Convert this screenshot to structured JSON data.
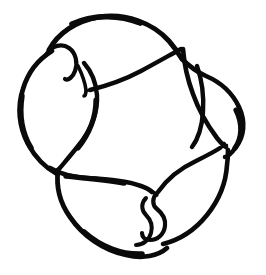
{
  "artwork": {
    "title": "Trefoil Knot",
    "subject": "three-crossing knot diagram",
    "style": "hand-drawn brush line drawing",
    "background_color": "#ffffff",
    "ink_color": "#0a0a0a",
    "canvas": {
      "width": 266,
      "height": 275
    },
    "symmetry": "3-fold rotational",
    "stroke_count": 3,
    "crossings": [
      {
        "name": "upper-left-crossing",
        "x": 75,
        "y": 62
      },
      {
        "name": "right-crossing",
        "x": 205,
        "y": 78
      },
      {
        "name": "lower-center-crossing",
        "x": 165,
        "y": 205
      }
    ],
    "line_ends": [
      {
        "name": "cusp-upper-left",
        "x": 92,
        "y": 92
      },
      {
        "name": "cusp-lower-left",
        "x": 62,
        "y": 178
      },
      {
        "name": "cusp-right",
        "x": 226,
        "y": 146
      }
    ],
    "stroke_width_range": {
      "min": 2,
      "max": 6
    }
  },
  "caption": {
    "text": "Trefoil knot — hand-drawn line art"
  }
}
